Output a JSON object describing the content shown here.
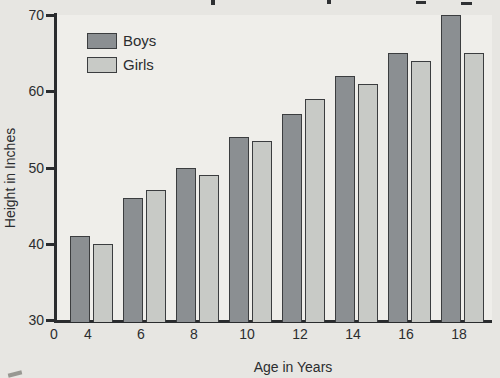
{
  "page": {
    "background": "#e7e6e2"
  },
  "chart": {
    "colors": {
      "background": "#e7e6e2",
      "plot_background": "#efeeea",
      "axis": "#2a2c2e",
      "text": "#2b2d2f",
      "bar_border": "#3b3d3f"
    }
  },
  "chart_data": {
    "type": "bar",
    "title": "",
    "xlabel": "Age in Years",
    "ylabel": "Height in Inches",
    "categories": [
      4,
      6,
      8,
      10,
      12,
      14,
      16,
      18
    ],
    "x_tick_labels": [
      "0",
      "4",
      "6",
      "8",
      "10",
      "12",
      "14",
      "16",
      "18"
    ],
    "y_ticks": [
      30,
      40,
      50,
      60,
      70
    ],
    "ylim": [
      30,
      70
    ],
    "grid": false,
    "legend_position": "top-left-inside",
    "series": [
      {
        "name": "Boys",
        "color": "#8b8f92",
        "values": [
          41,
          46,
          50,
          54,
          57,
          62,
          65,
          70
        ]
      },
      {
        "name": "Girls",
        "color": "#c8cac6",
        "values": [
          40,
          47,
          49,
          53.5,
          59,
          61,
          64,
          65
        ]
      }
    ]
  },
  "artifacts": {
    "top_edge_text_fragments": [
      {
        "x": 211,
        "y": 0,
        "w": 4,
        "h": 5
      },
      {
        "x": 327,
        "y": 0,
        "w": 4,
        "h": 4
      },
      {
        "x": 416,
        "y": 1,
        "w": 10,
        "h": 3
      },
      {
        "x": 461,
        "y": 2,
        "w": 11,
        "h": 3
      }
    ],
    "bottom_left_mark": {
      "x": 8,
      "y": 372,
      "w": 14,
      "h": 4
    }
  }
}
